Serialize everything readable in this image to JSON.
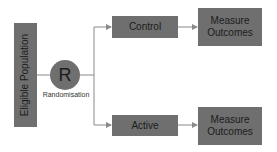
{
  "diagram": {
    "population": "Eligible Population",
    "randomisation_symbol": "R",
    "randomisation_label": "Randomisation",
    "arms": [
      {
        "label": "Control",
        "outcome": "Measure Outcomes"
      },
      {
        "label": "Active",
        "outcome": "Measure Outcomes"
      }
    ],
    "colors": {
      "box": "#6f6f6f",
      "line": "#8a8a8a",
      "text": "#1c1c1c"
    }
  }
}
